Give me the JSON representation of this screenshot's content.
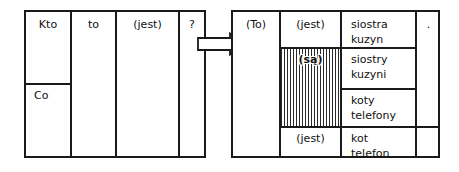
{
  "figure": {
    "kind": "grammar-transformation-diagram",
    "language": "pl",
    "stroke_color": "#1a1a1a",
    "background_color": "#ffffff"
  },
  "left_table": {
    "name": "question-pattern-table",
    "columns": [
      {
        "id": "subject",
        "label_top": "Kto",
        "label_bottom": "Co"
      },
      {
        "id": "to",
        "label": "to"
      },
      {
        "id": "copula",
        "label": "(jest)"
      },
      {
        "id": "qmark",
        "label": "?"
      }
    ],
    "cells": {
      "kto": "Kto",
      "co": "Co",
      "to": "to",
      "jest": "(jest)",
      "question_mark": "?"
    }
  },
  "arrow": {
    "name": "transformation-arrow",
    "direction": "right",
    "glyph": "⇒"
  },
  "right_table": {
    "name": "answer-pattern-table",
    "columns": [
      {
        "id": "to",
        "label": "(To)"
      },
      {
        "id": "copula",
        "label": "copula"
      },
      {
        "id": "predicate",
        "label": "predicate"
      },
      {
        "id": "period",
        "label": "."
      }
    ],
    "cells": {
      "to": "(To)",
      "copula_singular_top": "(jest)",
      "copula_plural": "(są)",
      "copula_singular_bottom": "(jest)",
      "period": "."
    },
    "predicates": [
      {
        "id": "p1",
        "lines": "siostra\nkuzyn",
        "number": "singular"
      },
      {
        "id": "p2",
        "lines": "siostry\nkuzyni",
        "number": "plural"
      },
      {
        "id": "p3",
        "lines": "koty\ntelefony",
        "number": "plural"
      },
      {
        "id": "p4",
        "lines": "kot\ntelefon",
        "number": "singular"
      }
    ]
  }
}
